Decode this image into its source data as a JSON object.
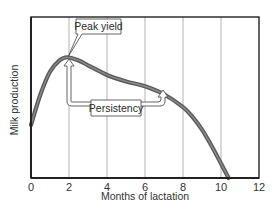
{
  "chart_data": {
    "type": "line",
    "title": "",
    "xlabel": "Months of lactation",
    "ylabel": "Milk production",
    "xlim": [
      0,
      12
    ],
    "ylim": [
      0,
      100
    ],
    "x_ticks": [
      "0",
      "2",
      "4",
      "6",
      "8",
      "10",
      "12"
    ],
    "y_ticks": [],
    "grid": {
      "vertical": true,
      "horizontal": false,
      "vertical_at": [
        2,
        4,
        6,
        8,
        10
      ]
    },
    "legend": null,
    "series": [
      {
        "name": "Lactation curve",
        "x": [
          0,
          0.5,
          1,
          1.5,
          1.9,
          2.5,
          3,
          4,
          5,
          6,
          7,
          8,
          8.5,
          9,
          9.5,
          10,
          10.4
        ],
        "y": [
          33,
          52,
          66,
          73,
          75,
          73,
          70,
          64,
          60,
          57,
          52,
          44,
          38,
          30,
          20,
          9,
          0
        ],
        "units": "relative (y-axis unlabeled)"
      }
    ],
    "annotations": [
      {
        "text": "Peak yield",
        "points_to": {
          "x": 1.9,
          "y": 75
        }
      },
      {
        "text": "Persistency",
        "arrows_to": [
          {
            "x": 2,
            "y": 75
          },
          {
            "x": 7,
            "y": 52
          }
        ]
      }
    ]
  },
  "colors": {
    "curve": "#5a5a5a",
    "curve_highlight": "#8a8a8a",
    "axes": "#222222",
    "gridlines": "#9a9a9a",
    "background": "#ffffff"
  }
}
